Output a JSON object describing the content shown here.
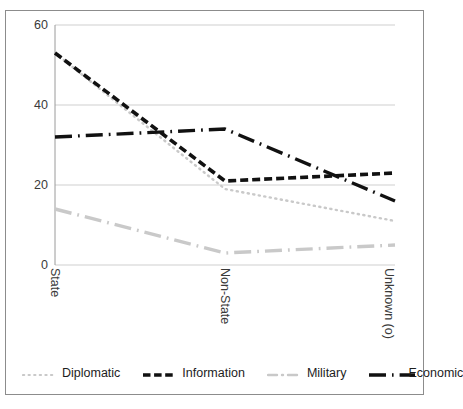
{
  "chart_data": {
    "type": "line",
    "title": "",
    "xlabel": "",
    "ylabel": "",
    "categories": [
      "State",
      "Non-State",
      "Unknown (o)"
    ],
    "ylim": [
      0,
      60
    ],
    "yticks": [
      0,
      20,
      40,
      60
    ],
    "grid": true,
    "legend_position": "bottom",
    "series": [
      {
        "name": "Diplomatic",
        "values": [
          53,
          19,
          11
        ],
        "color": "#c9c9c9",
        "style": "dotted",
        "swatch": "dotted-light"
      },
      {
        "name": "Information",
        "values": [
          53,
          21,
          23
        ],
        "color": "#111111",
        "style": "dashed",
        "swatch": "dashed-dark"
      },
      {
        "name": "Military",
        "values": [
          14,
          3,
          5
        ],
        "color": "#c9c9c9",
        "style": "dash-dot",
        "swatch": "dashdot-light"
      },
      {
        "name": "Economic",
        "values": [
          32,
          34,
          16
        ],
        "color": "#111111",
        "style": "dash-dot",
        "swatch": "dashdot-dark"
      }
    ]
  },
  "axes": {
    "ytick_labels": [
      "60",
      "40",
      "20",
      "0"
    ],
    "xtick_labels": [
      "State",
      "Non-State",
      "Unknown (o)"
    ]
  },
  "legend": {
    "entries": [
      {
        "label": "Diplomatic"
      },
      {
        "label": "Information"
      },
      {
        "label": "Military"
      },
      {
        "label": "Economic"
      }
    ]
  },
  "colors": {
    "light_series": "#c9c9c9",
    "dark_series": "#111111",
    "gridline": "#cfcfcf",
    "frame": "#8c8c8c",
    "text": "#3a3a3a"
  }
}
